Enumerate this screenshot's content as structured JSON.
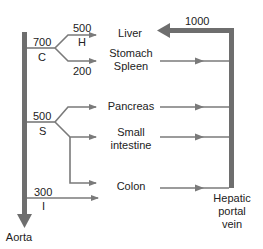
{
  "diagram": {
    "colors": {
      "vessel": "#7a7a7a",
      "text": "#222222",
      "background": "#ffffff"
    },
    "vessels": {
      "aorta": {
        "label": "Aorta"
      },
      "portal_vein": {
        "label_line1": "Hepatic",
        "label_line2": "portal",
        "label_line3": "vein",
        "flow": "1000"
      }
    },
    "branches": {
      "celiac": {
        "abbrev": "C",
        "flow": "700"
      },
      "hepatic": {
        "abbrev": "H",
        "flow": "500"
      },
      "splenic_gastric": {
        "flow": "200"
      },
      "superior_mesenteric": {
        "abbrev": "S",
        "flow": "500"
      },
      "inferior_mesenteric": {
        "abbrev": "I",
        "flow": "300"
      }
    },
    "organs": {
      "liver": "Liver",
      "stomach_line1": "Stomach",
      "stomach_line2": "Spleen",
      "pancreas": "Pancreas",
      "small_intestine_line1": "Small",
      "small_intestine_line2": "intestine",
      "colon": "Colon"
    }
  }
}
